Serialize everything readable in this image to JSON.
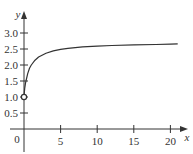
{
  "chart_data": {
    "type": "line",
    "title": "",
    "xlabel": "x",
    "ylabel": "y",
    "xlim": [
      0,
      21
    ],
    "ylim": [
      0,
      3.0
    ],
    "grid": false,
    "legend": null,
    "x_ticks": [
      {
        "value": 0,
        "label": "0"
      },
      {
        "value": 5,
        "label": "5"
      },
      {
        "value": 10,
        "label": "10"
      },
      {
        "value": 15,
        "label": "15"
      },
      {
        "value": 20,
        "label": "20"
      }
    ],
    "y_ticks": [
      {
        "value": 0.5,
        "label": "0.5"
      },
      {
        "value": 1.0,
        "label": "1.0"
      },
      {
        "value": 1.5,
        "label": "1.5"
      },
      {
        "value": 2.0,
        "label": "2.0"
      },
      {
        "value": 2.5,
        "label": "2.5"
      },
      {
        "value": 3.0,
        "label": "3.0"
      }
    ],
    "series": [
      {
        "name": "f(x)",
        "x": [
          0,
          0.05,
          0.1,
          0.2,
          0.3,
          0.5,
          0.75,
          1,
          1.5,
          2,
          3,
          4,
          5,
          6,
          8,
          10,
          12,
          15,
          18,
          20,
          21
        ],
        "y": [
          1.0,
          1.16,
          1.27,
          1.43,
          1.53,
          1.73,
          1.9,
          2.0,
          2.15,
          2.25,
          2.37,
          2.44,
          2.49,
          2.52,
          2.57,
          2.59,
          2.61,
          2.63,
          2.64,
          2.65,
          2.66
        ]
      }
    ],
    "annotations": [
      {
        "type": "open-circle",
        "x": 0,
        "y": 1.0
      }
    ],
    "color": "#333333"
  },
  "labels": {
    "x_axis": "x",
    "y_axis": "y",
    "origin": "0"
  }
}
